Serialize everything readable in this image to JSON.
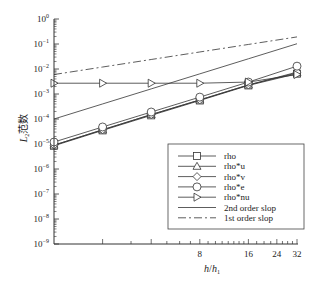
{
  "chart_data": {
    "type": "line",
    "title": "",
    "xlabel": "h/h1",
    "ylabel": "L2 范数",
    "xscale": "log2",
    "yscale": "log10",
    "xlim": [
      1,
      32
    ],
    "ylim": [
      1e-09,
      1
    ],
    "x_tick_labels": [
      "8",
      "16",
      "24",
      "32"
    ],
    "x_ticks": [
      8,
      16,
      24,
      32
    ],
    "y_tick_labels": [
      "10^0",
      "10^-1",
      "10^-2",
      "10^-3",
      "10^-4",
      "10^-5",
      "10^-6",
      "10^-7",
      "10^-8",
      "10^-9"
    ],
    "y_ticks": [
      1,
      0.1,
      0.01,
      0.001,
      0.0001,
      1e-05,
      1e-06,
      1e-07,
      1e-08,
      1e-09
    ],
    "grid": false,
    "legend_position": "lower right",
    "x": [
      1,
      2,
      4,
      8,
      16,
      32
    ],
    "series": [
      {
        "name": "rho",
        "marker": "square",
        "values": [
          8.5e-06,
          3.5e-05,
          0.00014,
          0.00055,
          0.0022,
          0.0065
        ]
      },
      {
        "name": "rho*u",
        "marker": "triangle-up",
        "values": [
          9e-06,
          3.7e-05,
          0.00015,
          0.00058,
          0.0023,
          0.007
        ]
      },
      {
        "name": "rho*v",
        "marker": "diamond",
        "values": [
          9e-06,
          3.7e-05,
          0.00015,
          0.00058,
          0.0023,
          0.0075
        ]
      },
      {
        "name": "rho*e",
        "marker": "circle",
        "values": [
          1.2e-05,
          4.8e-05,
          0.00019,
          0.00075,
          0.003,
          0.013
        ]
      },
      {
        "name": "rho*nu",
        "marker": "triangle-right",
        "values": [
          0.0027,
          0.0027,
          0.0027,
          0.0027,
          0.003,
          0.006
        ]
      },
      {
        "name": "2nd order slop",
        "marker": "none",
        "style": "solid",
        "values": [
          0.0001,
          0.0004,
          0.0016,
          0.0064,
          0.0256,
          0.1024
        ]
      },
      {
        "name": "1st order slop",
        "marker": "none",
        "style": "dashdot",
        "values": [
          0.006,
          0.012,
          0.024,
          0.048,
          0.096,
          0.192
        ]
      }
    ]
  },
  "axes": {
    "xlabel_main": "h",
    "xlabel_sep": "/",
    "xlabel_den": "h",
    "xlabel_den_sub": "1",
    "ylabel_main": "L",
    "ylabel_sub": "2",
    "ylabel_cn": "范数"
  },
  "legend": {
    "items": [
      "rho",
      "rho*u",
      "rho*v",
      "rho*e",
      "rho*nu",
      "2nd order slop",
      "1st order slop"
    ]
  }
}
